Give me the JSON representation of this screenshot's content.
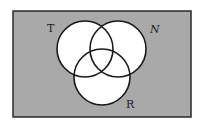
{
  "diagram": {
    "type": "venn",
    "universe": {
      "x": 13,
      "y": 11,
      "width": 178,
      "height": 106,
      "fill": "#a9a9a9",
      "stroke": "#2a2a2a"
    },
    "sets": [
      {
        "label": "T",
        "cx": 85,
        "cy": 49,
        "r": 28,
        "label_x": 47,
        "label_y": 32
      },
      {
        "label": "N",
        "cx": 118,
        "cy": 49,
        "r": 28,
        "label_x": 150,
        "label_y": 33
      },
      {
        "label": "R",
        "cx": 102,
        "cy": 77,
        "r": 28,
        "label_x": 126,
        "label_y": 108
      }
    ],
    "circle_fill": "#ffffff",
    "circle_stroke": "#1a1a1a"
  }
}
